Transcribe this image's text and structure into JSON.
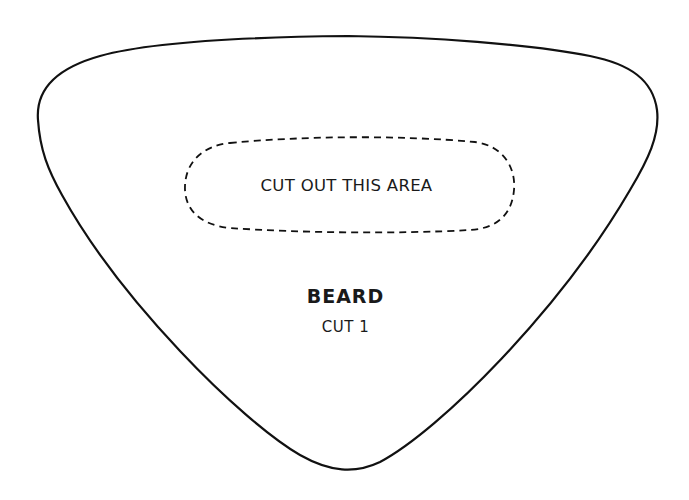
{
  "pattern": {
    "piece_name": "BEARD",
    "cut_instruction": "CUT 1",
    "cutout_label": "CUT OUT THIS AREA",
    "outline_color": "#111111",
    "background_color": "#ffffff"
  }
}
